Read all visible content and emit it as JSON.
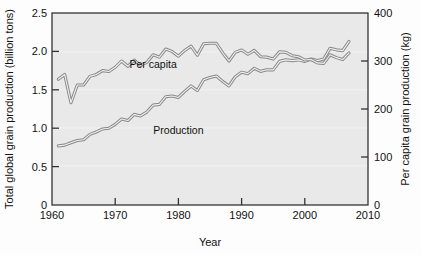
{
  "chart_data": {
    "type": "line",
    "title": "",
    "xlabel": "Year",
    "ylabel": "Total global grain production (billion tons)",
    "ylabel_right": "Per capita grain production (kg)",
    "xlim": [
      1960,
      2010
    ],
    "ylim": [
      0,
      2.5
    ],
    "ylim_right": [
      0,
      400
    ],
    "xticks": [
      1960,
      1970,
      1980,
      1990,
      2000,
      2010
    ],
    "xtick_labels": [
      "1960",
      "1970",
      "1980",
      "1990",
      "2000",
      "2010"
    ],
    "yticks": [
      0,
      0.5,
      1.0,
      1.5,
      2.0,
      2.5
    ],
    "ytick_labels": [
      "0",
      "0.5",
      "1.0",
      "1.5",
      "2.0",
      "2.5"
    ],
    "yticks_right": [
      0,
      100,
      200,
      300,
      400
    ],
    "ytick_labels_right": [
      "0",
      "100",
      "200",
      "300",
      "400"
    ],
    "grid": false,
    "legend_position": "inline-annotations",
    "line_color": "#8a8a8a",
    "plot_background": "#e9e9e9",
    "frame_color": "#333333",
    "x": [
      1961,
      1962,
      1963,
      1964,
      1965,
      1966,
      1967,
      1968,
      1969,
      1970,
      1971,
      1972,
      1973,
      1974,
      1975,
      1976,
      1977,
      1978,
      1979,
      1980,
      1981,
      1982,
      1983,
      1984,
      1985,
      1986,
      1987,
      1988,
      1989,
      1990,
      1991,
      1992,
      1993,
      1994,
      1995,
      1996,
      1997,
      1998,
      1999,
      2000,
      2001,
      2002,
      2003,
      2004,
      2005,
      2006,
      2007
    ],
    "series": [
      {
        "name": "Production",
        "units": "billion tons",
        "axis": "left",
        "label_annotation": "Production",
        "values": [
          0.77,
          0.78,
          0.81,
          0.84,
          0.85,
          0.92,
          0.95,
          0.99,
          1.0,
          1.05,
          1.12,
          1.1,
          1.18,
          1.16,
          1.21,
          1.3,
          1.31,
          1.41,
          1.42,
          1.4,
          1.48,
          1.55,
          1.49,
          1.63,
          1.66,
          1.68,
          1.61,
          1.55,
          1.67,
          1.73,
          1.71,
          1.78,
          1.74,
          1.76,
          1.76,
          1.87,
          1.89,
          1.88,
          1.89,
          1.87,
          1.9,
          1.88,
          1.9,
          2.04,
          2.02,
          2.01,
          2.13
        ]
      },
      {
        "name": "Per capita",
        "units": "kg",
        "axis": "right",
        "label_annotation": "Per capita",
        "values": [
          262,
          272,
          213,
          250,
          250,
          268,
          272,
          280,
          278,
          287,
          300,
          289,
          302,
          291,
          297,
          313,
          308,
          325,
          320,
          310,
          322,
          331,
          312,
          336,
          337,
          337,
          317,
          300,
          318,
          323,
          314,
          322,
          309,
          308,
          304,
          319,
          318,
          311,
          309,
          302,
          303,
          296,
          295,
          313,
          307,
          303,
          317
        ]
      }
    ],
    "annotations": [
      {
        "text": "Per capita",
        "x_year": 1976,
        "y_value_left": 1.78
      },
      {
        "text": "Production",
        "x_year": 1980,
        "y_value_left": 0.93
      }
    ]
  }
}
